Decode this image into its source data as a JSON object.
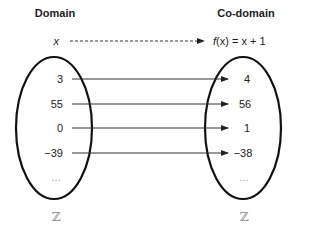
{
  "domain_label": "Domain",
  "codomain_label": "Co-domain",
  "general": {
    "input": "x",
    "output": "f(x) = x + 1",
    "output_fx": "f",
    "output_rest": "(x) = x + 1"
  },
  "mappings": [
    {
      "input": "3",
      "output": "4"
    },
    {
      "input": "55",
      "output": "56"
    },
    {
      "input": "0",
      "output": "1"
    },
    {
      "input": "−39",
      "output": "−38"
    }
  ],
  "ellipsis": "…",
  "domain_set": "ℤ",
  "codomain_set": "ℤ",
  "colors": {
    "line": "#333333",
    "ellipse": "#111111",
    "muted": "#999999"
  }
}
